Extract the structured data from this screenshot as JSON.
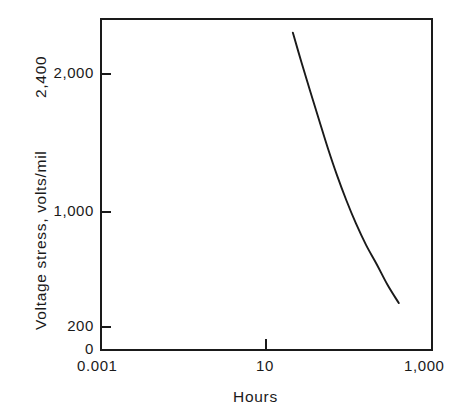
{
  "chart_data": {
    "type": "line",
    "title": "",
    "subtitle": "",
    "xlabel": "Hours",
    "ylabel": "Voltage stress, volts/mil",
    "xscale": "log",
    "yscale": "linear",
    "xlim": [
      0.001,
      1000
    ],
    "ylim": [
      0,
      2400
    ],
    "grid": false,
    "legend": null,
    "xticks": [
      {
        "value": 0.001,
        "label": "0.001"
      },
      {
        "value": 10,
        "label": "10"
      },
      {
        "value": 1000,
        "label": "1,000"
      }
    ],
    "yticks": [
      {
        "value": 2400,
        "label": "2,400"
      },
      {
        "value": 2000,
        "label": "2,000"
      },
      {
        "value": 1000,
        "label": "1,000"
      },
      {
        "value": 200,
        "label": "200"
      },
      {
        "value": 0,
        "label": "0"
      }
    ],
    "series": [
      {
        "name": "voltage-endurance-curve",
        "color": "#1a1a1a",
        "x": [
          3.0,
          4.3,
          6.2,
          9.0,
          13.0,
          19.0,
          28.0,
          42.0,
          64.0,
          100.0,
          155.0,
          250.0
        ],
        "y": [
          2300,
          2085,
          1875,
          1665,
          1460,
          1265,
          1085,
          915,
          760,
          620,
          475,
          340
        ]
      }
    ],
    "annotations": []
  },
  "axes": {
    "y_title": "Voltage stress, volts/mil",
    "y_top_label": "2,400",
    "x_title": "Hours"
  }
}
